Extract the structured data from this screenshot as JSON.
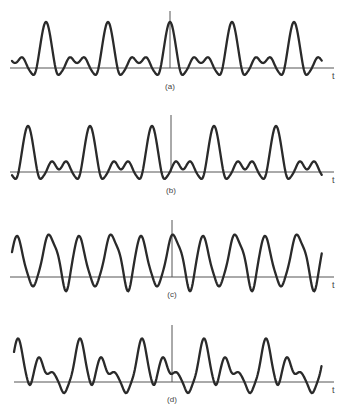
{
  "figure": {
    "axis_label": "t",
    "colors": {
      "waveform": "#2a2a2a",
      "axis": "#555555",
      "background": "#ffffff",
      "label": "#444444"
    }
  },
  "chart_data": [
    {
      "type": "line",
      "panel": "(a)",
      "caption": "(a)",
      "xlabel": "t",
      "ylabel": "",
      "grid": false,
      "description": "Periodic signal: tall narrow main peaks separated by a double-humped low plateau; dips slightly below axis on both sides of each main peak",
      "main_peaks_visible": 5,
      "main_peak_at_origin": true,
      "period_px": 62,
      "relative_values": {
        "main_peak": 1.0,
        "side_hump": 0.3,
        "trough": -0.05
      }
    },
    {
      "type": "line",
      "panel": "(b)",
      "caption": "(b)",
      "xlabel": "t",
      "ylabel": "",
      "grid": false,
      "description": "Same magnitude spectrum as (a) with shifted phase: main peaks displaced from origin, double humps between them",
      "main_peaks_visible": 5,
      "main_peak_at_origin": false,
      "period_px": 62,
      "relative_values": {
        "main_peak": 1.0,
        "side_hump": 0.3,
        "trough": -0.05
      }
    },
    {
      "type": "line",
      "panel": "(c)",
      "caption": "(c)",
      "xlabel": "t",
      "ylabel": "",
      "grid": false,
      "description": "Alternating pattern of narrow symmetric peaks and broad peaks with a shoulder on the falling side; deep troughs below axis",
      "peaks_visible": 10,
      "period_px": 62,
      "relative_values": {
        "peak": 1.0,
        "shoulder": 0.75,
        "trough": -0.25
      }
    },
    {
      "type": "line",
      "panel": "(d)",
      "caption": "(d)",
      "xlabel": "t",
      "ylabel": "",
      "grid": false,
      "description": "Tall peak followed by a smaller peak with a descending shoulder, repeating; small dips below axis",
      "main_peaks_visible": 5,
      "period_px": 62,
      "relative_values": {
        "main_peak": 1.0,
        "secondary_peak": 0.6,
        "shoulder": 0.25,
        "trough": -0.1
      }
    }
  ]
}
